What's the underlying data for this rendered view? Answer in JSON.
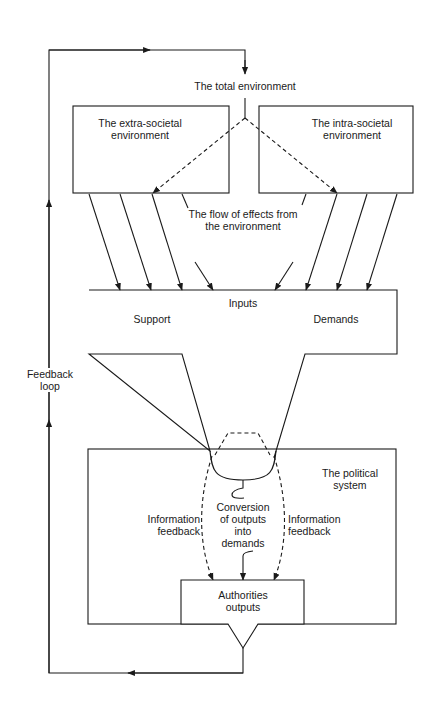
{
  "diagram": {
    "type": "systems-flow-diagram",
    "labels": {
      "total_environment": "The total environment",
      "extra_societal_line1": "The extra-societal",
      "extra_societal_line2": "environment",
      "intra_societal_line1": "The intra-societal",
      "intra_societal_line2": "environment",
      "flow_line1": "The flow of effects from",
      "flow_line2": "the environment",
      "inputs": "Inputs",
      "support": "Support",
      "demands": "Demands",
      "feedback_loop_line1": "Feedback",
      "feedback_loop_line2": "loop",
      "political_system_line1": "The political",
      "political_system_line2": "system",
      "info_feedback_left_line1": "Information",
      "info_feedback_left_line2": "feedback",
      "info_feedback_right_line1": "Information",
      "info_feedback_right_line2": "feedback",
      "conversion_line1": "Conversion",
      "conversion_line2": "of outputs",
      "conversion_line3": "into",
      "conversion_line4": "demands",
      "authorities_line1": "Authorities",
      "authorities_line2": "outputs"
    },
    "nodes": [
      {
        "id": "total-environment",
        "label": "The total environment"
      },
      {
        "id": "extra-societal-environment",
        "label": "The extra-societal environment"
      },
      {
        "id": "intra-societal-environment",
        "label": "The intra-societal environment"
      },
      {
        "id": "inputs",
        "label": "Inputs",
        "sub": [
          "Support",
          "Demands"
        ]
      },
      {
        "id": "political-system",
        "label": "The political system"
      },
      {
        "id": "authorities-outputs",
        "label": "Authorities outputs"
      }
    ],
    "edges": [
      {
        "from": "authorities-outputs",
        "to": "total-environment",
        "label": "Feedback loop",
        "style": "solid"
      },
      {
        "from": "total-environment",
        "to": "extra-societal-environment",
        "style": "dashed"
      },
      {
        "from": "total-environment",
        "to": "intra-societal-environment",
        "style": "dashed"
      },
      {
        "from": "extra-societal-environment",
        "to": "inputs",
        "count": 4,
        "label": "The flow of effects from the environment",
        "style": "solid"
      },
      {
        "from": "intra-societal-environment",
        "to": "inputs",
        "count": 4,
        "label": "The flow of effects from the environment",
        "style": "solid"
      },
      {
        "from": "inputs",
        "to": "political-system",
        "style": "funnel"
      },
      {
        "from": "political-system",
        "to": "authorities-outputs",
        "label": "Information feedback",
        "style": "dashed"
      },
      {
        "from": "political-system",
        "to": "authorities-outputs",
        "label": "Conversion of outputs into demands",
        "style": "solid"
      },
      {
        "from": "political-system",
        "to": "authorities-outputs",
        "label": "Information feedback",
        "style": "dashed"
      }
    ],
    "colors": {
      "stroke": "#1a1a1a",
      "background": "#ffffff"
    }
  }
}
